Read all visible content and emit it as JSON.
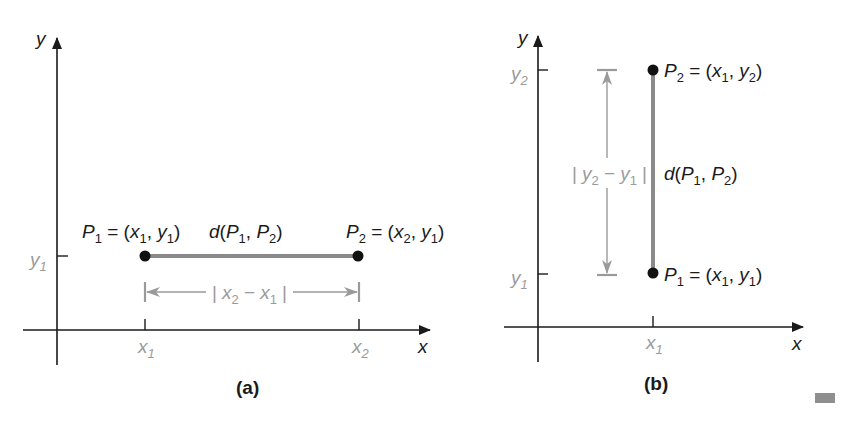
{
  "colors": {
    "axis": "#1a1a1a",
    "segment": "#8a8a8a",
    "dimension": "#9a9a9a",
    "point": "#111111",
    "tick_label": "#9a9a9a",
    "marker_block": "#8f8f8f"
  },
  "panel_a": {
    "caption": "(a)",
    "axis_x_label": "x",
    "axis_y_label": "y",
    "tick_y1": "y",
    "tick_y1_sub": "1",
    "tick_x1": "x",
    "tick_x1_sub": "1",
    "tick_x2": "x",
    "tick_x2_sub": "2",
    "p1_label": {
      "P": "P",
      "Psub": "1",
      "eq": " = (",
      "x": "x",
      "xsub": "1",
      "comma": ", ",
      "y": "y",
      "ysub": "1",
      "close": ")"
    },
    "p2_label": {
      "P": "P",
      "Psub": "2",
      "eq": " = (",
      "x": "x",
      "xsub": "2",
      "comma": ", ",
      "y": "y",
      "ysub": "1",
      "close": ")"
    },
    "distance_label": {
      "d": "d",
      "open": "(",
      "P1": "P",
      "P1sub": "1",
      "comma": ", ",
      "P2": "P",
      "P2sub": "2",
      "close": ")"
    },
    "dimension_label": {
      "bar": "|",
      "a": "x",
      "asub": "2",
      "minus": " − ",
      "b": "x",
      "bsub": "1",
      "bar2": "|"
    }
  },
  "panel_b": {
    "caption": "(b)",
    "axis_x_label": "x",
    "axis_y_label": "y",
    "tick_y1": "y",
    "tick_y1_sub": "1",
    "tick_y2": "y",
    "tick_y2_sub": "2",
    "tick_x1": "x",
    "tick_x1_sub": "1",
    "p1_label": {
      "P": "P",
      "Psub": "1",
      "eq": " = (",
      "x": "x",
      "xsub": "1",
      "comma": ", ",
      "y": "y",
      "ysub": "1",
      "close": ")"
    },
    "p2_label": {
      "P": "P",
      "Psub": "2",
      "eq": " = (",
      "x": "x",
      "xsub": "1",
      "comma": ", ",
      "y": "y",
      "ysub": "2",
      "close": ")"
    },
    "distance_label": {
      "d": "d",
      "open": "(",
      "P1": "P",
      "P1sub": "1",
      "comma": ", ",
      "P2": "P",
      "P2sub": "2",
      "close": ")"
    },
    "dimension_label": {
      "bar": "|",
      "a": "y",
      "asub": "2",
      "minus": " − ",
      "b": "y",
      "bsub": "1",
      "bar2": "|"
    }
  }
}
